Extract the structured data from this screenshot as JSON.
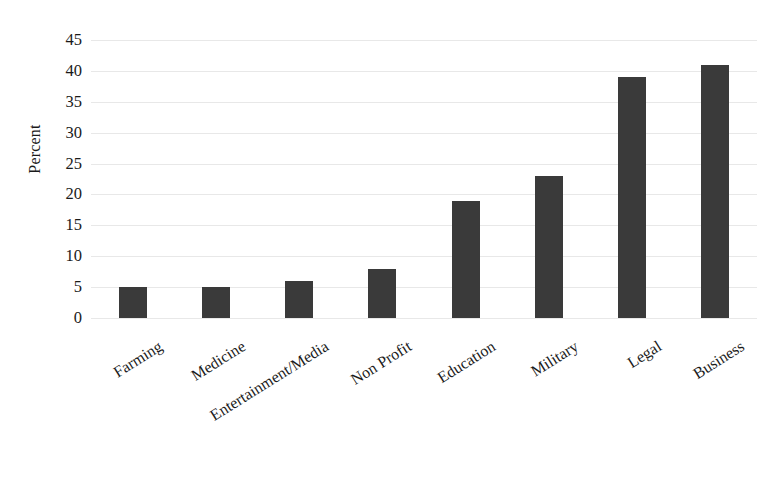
{
  "chart_data": {
    "type": "bar",
    "title": "",
    "subtitle": "",
    "xlabel": "",
    "ylabel": "Percent",
    "ylim": [
      0,
      45
    ],
    "ytick_step": 5,
    "yticks": [
      "45",
      "40",
      "35",
      "30",
      "25",
      "20",
      "15",
      "10",
      "5",
      "0"
    ],
    "grid": true,
    "legend": false,
    "legend_position": "none",
    "bar_color": "#3a3a3a",
    "gridline_color": "#e8e8e8",
    "background_color": "#ffffff",
    "categories": [
      "Farming",
      "Medicine",
      "Entertainment/Media",
      "Non Profit",
      "Education",
      "Military",
      "Legal",
      "Business"
    ],
    "values": [
      5,
      5,
      6,
      8,
      19,
      23,
      39,
      41
    ]
  }
}
